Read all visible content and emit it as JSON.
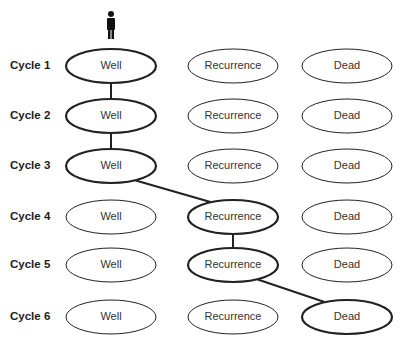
{
  "diagram": {
    "rows": [
      {
        "label": "Cycle 1",
        "y": 66
      },
      {
        "label": "Cycle 2",
        "y": 116
      },
      {
        "label": "Cycle 3",
        "y": 166
      },
      {
        "label": "Cycle 4",
        "y": 217
      },
      {
        "label": "Cycle 5",
        "y": 265
      },
      {
        "label": "Cycle 6",
        "y": 317
      }
    ],
    "states": [
      "Well",
      "Recurrence",
      "Dead"
    ],
    "columns_x": [
      111,
      233,
      347
    ],
    "path": [
      {
        "cycle": 1,
        "state": "Well"
      },
      {
        "cycle": 2,
        "state": "Well"
      },
      {
        "cycle": 3,
        "state": "Well"
      },
      {
        "cycle": 4,
        "state": "Recurrence"
      },
      {
        "cycle": 5,
        "state": "Recurrence"
      },
      {
        "cycle": 6,
        "state": "Dead"
      }
    ],
    "icon": "person-icon",
    "colors": {
      "stroke": "#222222",
      "text": "#333333",
      "background": "#ffffff"
    }
  }
}
